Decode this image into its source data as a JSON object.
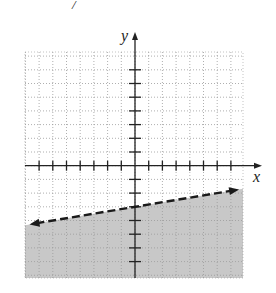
{
  "header_fragment": "/",
  "chart_data": {
    "type": "line",
    "title": "",
    "xlabel": "x",
    "ylabel": "y",
    "xlim": [
      -8,
      8
    ],
    "ylim": [
      -8,
      8
    ],
    "grid": true,
    "grid_style": "dotted",
    "tick_interval": 1,
    "tick_labels": "none",
    "boundary": {
      "equation": "y = (1/6)x - 3",
      "slope": 0.1667,
      "y_intercept": -3,
      "style": "dashed",
      "arrows": "both",
      "endpoints": [
        [
          -7.7,
          -4.28
        ],
        [
          7.6,
          -1.73
        ]
      ]
    },
    "inequality": "y < (1/6)x - 3",
    "shaded_region": "below the line",
    "colors": {
      "shade": "#c8c8c8",
      "grid": "#9a9a9a",
      "axis": "#222222",
      "line": "#1a1a1a"
    }
  }
}
